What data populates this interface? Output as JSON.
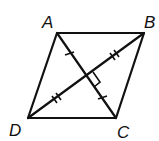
{
  "diagram": {
    "type": "geometry",
    "shape": "rhombus",
    "vertices": [
      {
        "label": "A",
        "x": 57,
        "y": 33
      },
      {
        "label": "B",
        "x": 144,
        "y": 33
      },
      {
        "label": "C",
        "x": 116,
        "y": 118
      },
      {
        "label": "D",
        "x": 28,
        "y": 118
      }
    ],
    "diagonals": [
      "AC",
      "BD"
    ],
    "marks": {
      "right_angle": "diagonals perpendicular at intersection",
      "single_tick": "AC halves congruent",
      "double_tick": "BD halves congruent"
    },
    "stroke_color": "#111111"
  }
}
